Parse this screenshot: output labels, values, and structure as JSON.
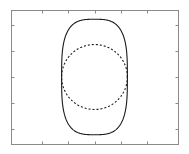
{
  "figure": {
    "title": "",
    "background_color": "#ffffff",
    "width": 189,
    "height": 154
  },
  "chart_data": {
    "type": "line",
    "title": "",
    "subtitle": "",
    "xlabel": "",
    "ylabel": "",
    "grid": false,
    "legend": null,
    "axis_box": {
      "color": "#8a8a8a",
      "line_width": 1,
      "left_px": 11,
      "top_px": 10,
      "right_px": 178,
      "bottom_px": 144
    },
    "xlim": [
      -1.6,
      1.6
    ],
    "ylim": [
      -1.3,
      1.3
    ],
    "xticks": [
      -1.0,
      -0.5,
      0.0,
      0.5,
      1.0
    ],
    "yticks": [
      -1.0,
      -0.5,
      0.0,
      0.5,
      1.0
    ],
    "xticklabels": [
      "",
      "",
      "",
      "",
      ""
    ],
    "yticklabels": [
      "",
      "",
      "",
      "",
      ""
    ],
    "tick_direction": "in",
    "tick_length_px": 3,
    "tick_color": "#8a8a8a",
    "series": [
      {
        "name": "outer-superellipse",
        "style": "solid",
        "color": "#1a1a1a",
        "line_width": 1.1,
        "closed": true,
        "shape": "superellipse",
        "center": [
          0.0,
          0.0
        ],
        "semi_axis_x": 0.63,
        "semi_axis_y": 1.12,
        "exponent": 3.2
      },
      {
        "name": "inner-circle",
        "style": "dashed",
        "color": "#1a1a1a",
        "line_width": 1.1,
        "dash_pattern": [
          2,
          2
        ],
        "closed": true,
        "shape": "circle",
        "center": [
          0.0,
          0.0
        ],
        "radius": 0.63
      }
    ],
    "annotations": []
  }
}
